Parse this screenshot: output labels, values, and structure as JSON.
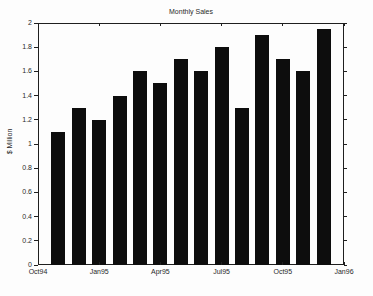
{
  "figure": {
    "title": "Monthly Sales",
    "ylabel": "$ Million"
  },
  "chart_data": {
    "type": "bar",
    "title": "Monthly Sales",
    "xlabel": "",
    "ylabel": "$ Million",
    "categories": [
      "Nov94",
      "Dec94",
      "Jan95",
      "Feb95",
      "Mar95",
      "Apr95",
      "May95",
      "Jun95",
      "Jul95",
      "Aug95",
      "Sep95",
      "Oct95",
      "Nov95",
      "Dec95"
    ],
    "values": [
      1.1,
      1.3,
      1.2,
      1.4,
      1.6,
      1.5,
      1.7,
      1.6,
      1.8,
      1.3,
      1.9,
      1.7,
      1.6,
      1.95
    ],
    "ylim": [
      0,
      2
    ],
    "x_axis_span_months": 15,
    "x_tick_labels": [
      "Oct94",
      "Jan95",
      "Apr95",
      "Jul95",
      "Oct95",
      "Jan96"
    ],
    "x_tick_month_positions": [
      0,
      3,
      6,
      9,
      12,
      15
    ],
    "y_tick_values": [
      0,
      0.2,
      0.4,
      0.6,
      0.8,
      1,
      1.2,
      1.4,
      1.6,
      1.8,
      2
    ],
    "y_tick_labels": [
      "0",
      "0.2",
      "0.4",
      "0.6",
      "0.8",
      "1",
      "1.2",
      "1.4",
      "1.6",
      "1.8",
      "2"
    ],
    "grid": false,
    "legend_position": "none",
    "bar_color": "#0d0d0d",
    "axis_color": "#1f1f1f",
    "background_color": "#fdfdfd"
  }
}
